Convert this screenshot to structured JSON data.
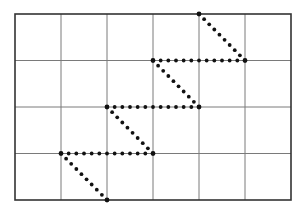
{
  "diagram": {
    "type": "grid-with-dotted-path",
    "grid": {
      "columns": 6,
      "rows": 4,
      "origin": [
        15,
        14
      ],
      "cell_width": 46,
      "cell_height": 46.5,
      "line_color": "#7a7a7a",
      "border_color": "#333333"
    },
    "path": {
      "color": "#111111",
      "style": "dotted",
      "dot_spacing": 7.5,
      "dot_radius": 1.9,
      "vertex_radius": 2.4,
      "vertices_grid": [
        [
          2,
          4
        ],
        [
          1,
          3
        ],
        [
          3,
          3
        ],
        [
          2,
          2
        ],
        [
          4,
          2
        ],
        [
          3,
          1
        ],
        [
          5,
          1
        ],
        [
          4,
          0
        ]
      ],
      "description": "Staircase zigzag: diagonal up-left one cell, then horizontal right two cells, repeated, from bottom edge to top edge"
    }
  }
}
